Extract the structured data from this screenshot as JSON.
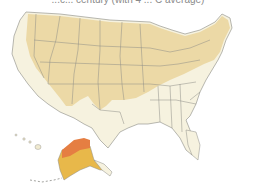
{
  "caption": "...c... century (with 4 ... C average)",
  "map": {
    "region": "United States",
    "colors": {
      "background": "#ffffff",
      "base_land": "#f6f2df",
      "zone_light_tan": "#ecd9a6",
      "zone_yellow": "#e8b84a",
      "zone_orange": "#e57e42",
      "borders": "#8c8c86"
    },
    "inset_labels": []
  }
}
